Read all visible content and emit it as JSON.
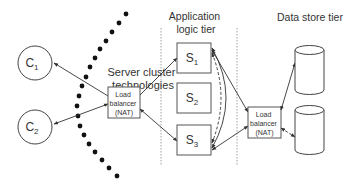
{
  "diagram": {
    "title_server_cluster": [
      "Server cluster",
      "technologies"
    ],
    "title_app_tier": [
      "Application",
      "logic tier"
    ],
    "title_data_tier": "Data store tier",
    "clients": [
      {
        "label": "C",
        "sub": "1"
      },
      {
        "label": "C",
        "sub": "2"
      }
    ],
    "servers": [
      {
        "label": "S",
        "sub": "1"
      },
      {
        "label": "S",
        "sub": "2"
      },
      {
        "label": "S",
        "sub": "3"
      }
    ],
    "load_balancer_left": [
      "Load",
      "balancer",
      "(NAT)"
    ],
    "load_balancer_right": [
      "Load",
      "balancer",
      "(NAT)"
    ],
    "data_stores": [
      "database",
      "database"
    ]
  }
}
